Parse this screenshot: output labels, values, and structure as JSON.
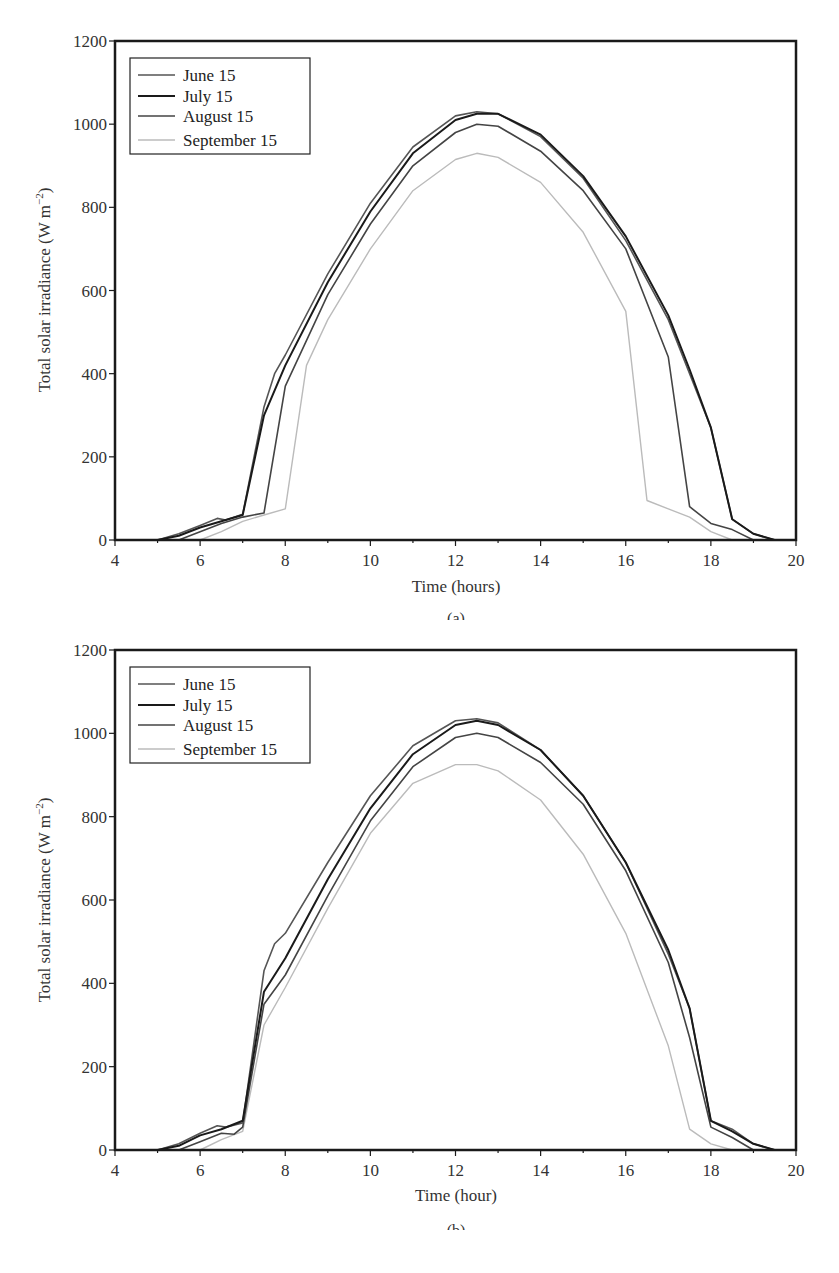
{
  "chart_data": [
    {
      "panel": "(a)",
      "type": "line",
      "title": "",
      "xlabel": "Time (hours)",
      "ylabel": "Total solar irradiance (W m⁻²)",
      "xlim": [
        4,
        20
      ],
      "ylim": [
        0,
        1200
      ],
      "xticks": [
        4,
        6,
        8,
        10,
        12,
        14,
        16,
        18,
        20
      ],
      "yticks": [
        0,
        200,
        400,
        600,
        800,
        1000,
        1200
      ],
      "grid": false,
      "legend_position": "upper-left",
      "series": [
        {
          "name": "June 15",
          "color": "#555555",
          "width": 1.6,
          "x": [
            5,
            5.5,
            6,
            6.4,
            6.6,
            7,
            7.5,
            7.75,
            8,
            9,
            10,
            11,
            12,
            12.5,
            13,
            14,
            15,
            16,
            17,
            17.5,
            18,
            18.5,
            19,
            19.5
          ],
          "y": [
            0,
            15,
            35,
            52,
            48,
            62,
            320,
            400,
            445,
            640,
            810,
            945,
            1020,
            1030,
            1025,
            970,
            870,
            720,
            530,
            400,
            270,
            50,
            15,
            0
          ]
        },
        {
          "name": "July 15",
          "color": "#1a1a1a",
          "width": 2.0,
          "x": [
            5,
            5.5,
            6,
            6.5,
            7,
            7.5,
            8,
            9,
            10,
            11,
            12,
            12.5,
            13,
            14,
            15,
            16,
            17,
            17.5,
            18,
            18.5,
            19,
            19.5
          ],
          "y": [
            0,
            10,
            30,
            45,
            60,
            300,
            420,
            620,
            790,
            930,
            1010,
            1025,
            1025,
            975,
            875,
            730,
            540,
            410,
            270,
            50,
            15,
            0
          ]
        },
        {
          "name": "August 15",
          "color": "#444444",
          "width": 1.6,
          "x": [
            5.5,
            6,
            6.5,
            7,
            7.5,
            8,
            9,
            10,
            11,
            12,
            12.5,
            13,
            14,
            15,
            16,
            17,
            17.5,
            18,
            18.5,
            19
          ],
          "y": [
            0,
            20,
            40,
            55,
            65,
            370,
            590,
            760,
            900,
            980,
            1000,
            995,
            935,
            840,
            700,
            440,
            80,
            40,
            25,
            0
          ]
        },
        {
          "name": "September 15",
          "color": "#bbbbbb",
          "width": 1.4,
          "x": [
            6,
            6.5,
            7,
            7.5,
            8,
            8.5,
            9,
            10,
            11,
            12,
            12.5,
            13,
            14,
            15,
            16,
            16.5,
            17,
            17.5,
            18,
            18.5
          ],
          "y": [
            0,
            20,
            45,
            60,
            75,
            420,
            530,
            700,
            840,
            915,
            930,
            920,
            860,
            740,
            550,
            95,
            75,
            55,
            20,
            0
          ]
        }
      ]
    },
    {
      "panel": "(b)",
      "type": "line",
      "title": "",
      "xlabel": "Time (hour)",
      "ylabel": "Total solar irradiance (W m⁻²)",
      "xlim": [
        4,
        20
      ],
      "ylim": [
        0,
        1200
      ],
      "xticks": [
        4,
        6,
        8,
        10,
        12,
        14,
        16,
        18,
        20
      ],
      "yticks": [
        0,
        200,
        400,
        600,
        800,
        1000,
        1200
      ],
      "grid": false,
      "legend_position": "upper-left",
      "series": [
        {
          "name": "June 15",
          "color": "#555555",
          "width": 1.6,
          "x": [
            5,
            5.5,
            6,
            6.4,
            6.6,
            7,
            7.5,
            7.75,
            8,
            9,
            10,
            11,
            12,
            12.5,
            13,
            14,
            15,
            16,
            17,
            17.5,
            18,
            18.5,
            19,
            19.5
          ],
          "y": [
            0,
            15,
            40,
            58,
            55,
            65,
            430,
            495,
            520,
            690,
            850,
            970,
            1030,
            1035,
            1025,
            960,
            850,
            690,
            470,
            340,
            70,
            50,
            15,
            0
          ]
        },
        {
          "name": "July 15",
          "color": "#1a1a1a",
          "width": 2.0,
          "x": [
            5,
            5.5,
            6,
            6.5,
            7,
            7.5,
            8,
            9,
            10,
            11,
            12,
            12.5,
            13,
            14,
            15,
            16,
            17,
            17.5,
            18,
            18.5,
            19,
            19.5
          ],
          "y": [
            0,
            10,
            35,
            50,
            70,
            380,
            460,
            650,
            820,
            950,
            1020,
            1030,
            1020,
            960,
            850,
            690,
            480,
            340,
            70,
            45,
            15,
            0
          ]
        },
        {
          "name": "August 15",
          "color": "#444444",
          "width": 1.6,
          "x": [
            5.5,
            6,
            6.5,
            6.8,
            7,
            7.5,
            8,
            9,
            10,
            11,
            12,
            12.5,
            13,
            14,
            15,
            16,
            17,
            17.5,
            18,
            18.5,
            19
          ],
          "y": [
            0,
            20,
            40,
            38,
            55,
            350,
            420,
            610,
            790,
            920,
            990,
            1000,
            990,
            930,
            830,
            670,
            450,
            270,
            55,
            30,
            0
          ]
        },
        {
          "name": "September 15",
          "color": "#bbbbbb",
          "width": 1.4,
          "x": [
            6,
            6.5,
            7,
            7.5,
            8,
            9,
            10,
            11,
            12,
            12.5,
            13,
            14,
            15,
            16,
            17,
            17.5,
            18,
            18.5
          ],
          "y": [
            0,
            25,
            45,
            300,
            390,
            580,
            760,
            880,
            925,
            925,
            910,
            840,
            710,
            520,
            250,
            50,
            15,
            0
          ]
        }
      ]
    }
  ],
  "panels": {
    "a": {
      "caption": "(a)",
      "xlabel": "Time (hours)",
      "ylabel_main": "Total solar irradiance (W m",
      "ylabel_sup": "−2",
      "ylabel_end": ")",
      "legend": [
        "June 15",
        "July 15",
        "August 15",
        "September 15"
      ]
    },
    "b": {
      "caption": "(b)",
      "xlabel": "Time (hour)",
      "ylabel_main": "Total solar irradiance (W m",
      "ylabel_sup": "−2",
      "ylabel_end": ")",
      "legend": [
        "June 15",
        "July 15",
        "August 15",
        "September 15"
      ]
    }
  },
  "xtick_labels": [
    "4",
    "6",
    "8",
    "10",
    "12",
    "14",
    "16",
    "18",
    "20"
  ],
  "ytick_labels": [
    "0",
    "200",
    "400",
    "600",
    "800",
    "1000",
    "1200"
  ]
}
